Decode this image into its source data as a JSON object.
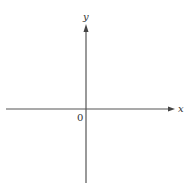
{
  "diagram": {
    "type": "cartesian-axes",
    "x_axis": {
      "label": "x"
    },
    "y_axis": {
      "label": "y"
    },
    "origin": {
      "label": "0"
    },
    "colors": {
      "axis": "#555555",
      "text": "#333333",
      "background": "#ffffff"
    }
  }
}
